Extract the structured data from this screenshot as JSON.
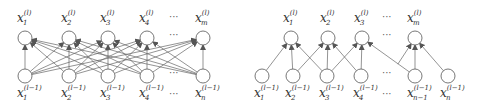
{
  "diagrams": [
    {
      "name": "fully-connected",
      "top_labels": [
        {
          "base": "x",
          "sub": "1",
          "sup": "(l)"
        },
        {
          "base": "x",
          "sub": "2",
          "sup": "(l)"
        },
        {
          "base": "x",
          "sub": "3",
          "sup": "(l)"
        },
        {
          "base": "x",
          "sub": "4",
          "sup": "(l)"
        },
        {
          "base": "x",
          "sub": "m",
          "sup": "(l)"
        }
      ],
      "bottom_labels": [
        {
          "base": "x",
          "sub": "1",
          "sup": "(l−1)"
        },
        {
          "base": "x",
          "sub": "2",
          "sup": "(l−1)"
        },
        {
          "base": "x",
          "sub": "3",
          "sup": "(l−1)"
        },
        {
          "base": "x",
          "sub": "4",
          "sup": "(l−1)"
        },
        {
          "base": "x",
          "sub": "n",
          "sup": "(l−1)"
        }
      ],
      "ellipsis": "···",
      "connections": "all-to-all"
    },
    {
      "name": "locally-connected",
      "top_labels": [
        {
          "base": "x",
          "sub": "1",
          "sup": "(l)"
        },
        {
          "base": "x",
          "sub": "2",
          "sup": "(l)"
        },
        {
          "base": "x",
          "sub": "3",
          "sup": "(l)"
        },
        {
          "base": "x",
          "sub": "m",
          "sup": "(l)"
        }
      ],
      "bottom_labels": [
        {
          "base": "x",
          "sub": "1",
          "sup": "(l−1)"
        },
        {
          "base": "x",
          "sub": "2",
          "sup": "(l−1)"
        },
        {
          "base": "x",
          "sub": "3",
          "sup": "(l−1)"
        },
        {
          "base": "x",
          "sub": "4",
          "sup": "(l−1)"
        },
        {
          "base": "x",
          "sub": "n−1",
          "sup": "(l−1)"
        },
        {
          "base": "x",
          "sub": "n",
          "sup": "(l−1)"
        }
      ],
      "ellipsis": "···",
      "connections": [
        [
          0,
          1,
          2
        ],
        [
          1,
          2,
          3
        ],
        [
          2,
          3,
          4
        ],
        [
          null,
          4,
          5
        ]
      ]
    }
  ],
  "colors": {
    "stroke": "#555555",
    "node_fill": "#ffffff",
    "edge": "#666666"
  }
}
